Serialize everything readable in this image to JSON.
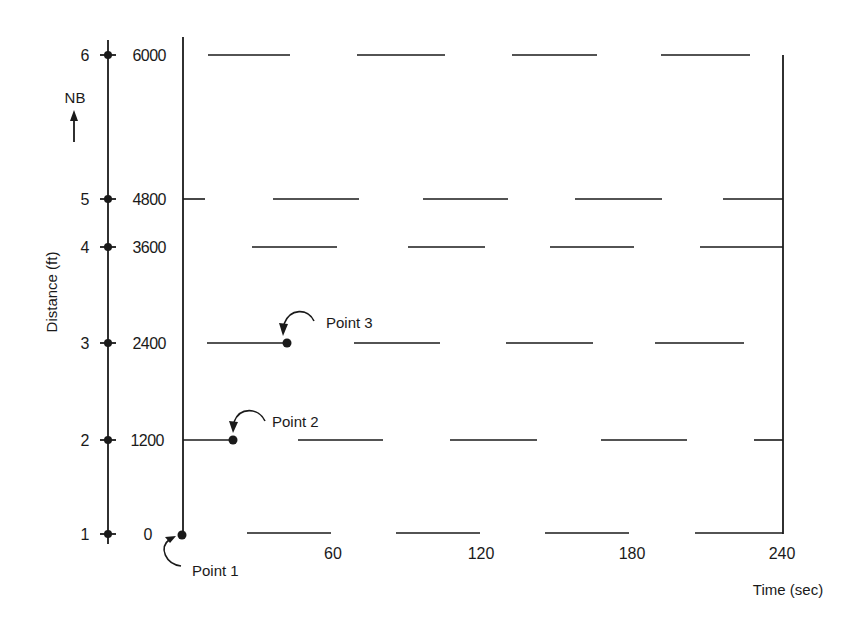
{
  "diagram": {
    "type": "time-space diagram (signal progression)",
    "y_axis": {
      "title": "Distance (ft)",
      "direction_label": "NB",
      "direction_arrow": "up-arrow-icon",
      "nodes": [
        {
          "id": "1",
          "distance": "0"
        },
        {
          "id": "2",
          "distance": "1200"
        },
        {
          "id": "3",
          "distance": "2400"
        },
        {
          "id": "4",
          "distance": "3600"
        },
        {
          "id": "5",
          "distance": "4800"
        },
        {
          "id": "6",
          "distance": "6000"
        }
      ]
    },
    "x_axis": {
      "title": "Time (sec)",
      "ticks": [
        "60",
        "120",
        "180",
        "240"
      ]
    },
    "annotations": [
      {
        "label": "Point 1",
        "node": "1",
        "time_sec": 0
      },
      {
        "label": "Point 2",
        "node": "2",
        "time_sec": 20
      },
      {
        "label": "Point 3",
        "node": "3",
        "time_sec": 42
      }
    ],
    "green_bands_px": {
      "node_6": [
        [
          208,
          290
        ],
        [
          357,
          445
        ],
        [
          512,
          597
        ],
        [
          661,
          750
        ]
      ],
      "node_5": [
        [
          183,
          205
        ],
        [
          273,
          359
        ],
        [
          423,
          508
        ],
        [
          575,
          662
        ],
        [
          723,
          783
        ]
      ],
      "node_4": [
        [
          252,
          337
        ],
        [
          408,
          485
        ],
        [
          550,
          634
        ],
        [
          700,
          783
        ]
      ],
      "node_3": [
        [
          207,
          287
        ],
        [
          354,
          440
        ],
        [
          506,
          593
        ],
        [
          655,
          744
        ]
      ],
      "node_2": [
        [
          183,
          233
        ],
        [
          298,
          383
        ],
        [
          450,
          537
        ],
        [
          601,
          687
        ],
        [
          754,
          783
        ]
      ],
      "node_1": [
        [
          247,
          331
        ],
        [
          396,
          480
        ],
        [
          545,
          629
        ],
        [
          695,
          783
        ]
      ]
    }
  }
}
